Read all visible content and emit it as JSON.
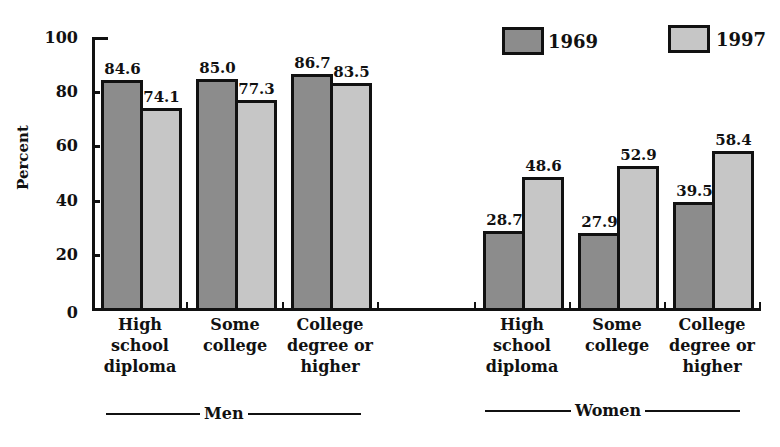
{
  "chart_data": {
    "type": "bar",
    "title": "",
    "xlabel": "",
    "ylabel": "Percent",
    "ylim": [
      0,
      100
    ],
    "yticks": [
      0,
      20,
      40,
      60,
      80,
      100
    ],
    "grid": false,
    "legend_position": "top-right",
    "groups": [
      {
        "name": "Men",
        "categories": [
          "High school diploma",
          "Some college",
          "College degree or higher"
        ],
        "series": [
          {
            "name": "1969",
            "values": [
              84.6,
              85.0,
              86.7
            ]
          },
          {
            "name": "1997",
            "values": [
              74.1,
              77.3,
              83.5
            ]
          }
        ]
      },
      {
        "name": "Women",
        "categories": [
          "High school diploma",
          "Some college",
          "College degree or higher"
        ],
        "series": [
          {
            "name": "1969",
            "values": [
              28.7,
              27.9,
              39.5
            ]
          },
          {
            "name": "1997",
            "values": [
              48.6,
              52.9,
              58.4
            ]
          }
        ]
      }
    ],
    "series_colors": {
      "1969": "#8c8c8c",
      "1997": "#c6c6c6"
    }
  },
  "axis": {
    "ylabel": "Percent",
    "ticks": [
      "0",
      "20",
      "40",
      "60",
      "80",
      "100"
    ]
  },
  "legend": [
    {
      "label": "1969",
      "color": "#8c8c8c"
    },
    {
      "label": "1997",
      "color": "#c6c6c6"
    }
  ],
  "groups": [
    {
      "label": "Men",
      "categories": [
        {
          "lines": [
            "High",
            "school",
            "diploma"
          ],
          "v1969": "84.6",
          "v1997": "74.1"
        },
        {
          "lines": [
            "Some",
            "college"
          ],
          "v1969": "85.0",
          "v1997": "77.3"
        },
        {
          "lines": [
            "College",
            "degree or",
            "higher"
          ],
          "v1969": "86.7",
          "v1997": "83.5"
        }
      ]
    },
    {
      "label": "Women",
      "categories": [
        {
          "lines": [
            "High",
            "school",
            "diploma"
          ],
          "v1969": "28.7",
          "v1997": "48.6"
        },
        {
          "lines": [
            "Some",
            "college"
          ],
          "v1969": "27.9",
          "v1997": "52.9"
        },
        {
          "lines": [
            "College",
            "degree or",
            "higher"
          ],
          "v1969": "39.5",
          "v1997": "58.4"
        }
      ]
    }
  ]
}
